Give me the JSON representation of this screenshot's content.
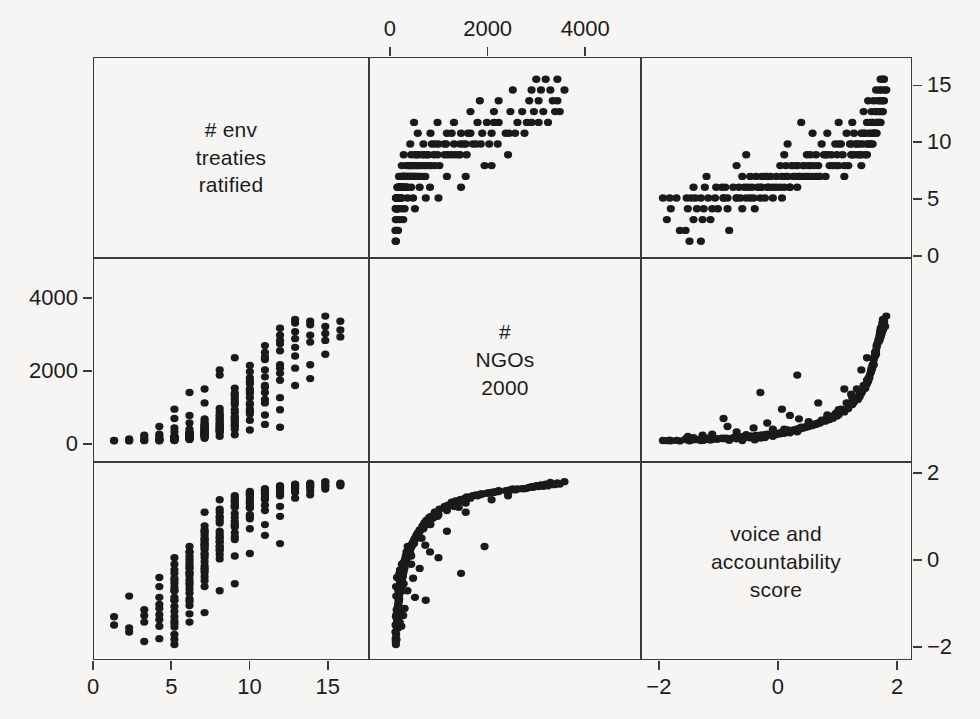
{
  "figure": {
    "type": "scatterplot-matrix",
    "background_color": "#f6f5f3",
    "point_color": "#1a1a1a",
    "frame_color": "#3b3b3b",
    "n_variables": 3
  },
  "variables": [
    {
      "key": "treaties",
      "label_lines": [
        "# env",
        "treaties",
        "ratified"
      ],
      "range": [
        0,
        17.5
      ],
      "ticks": [
        0,
        5,
        10,
        15
      ],
      "tick_labels": [
        "0",
        "5",
        "10",
        "15"
      ]
    },
    {
      "key": "ngos",
      "label_lines": [
        "#",
        "NGOs",
        "2000"
      ],
      "range": [
        -430,
        5100
      ],
      "ticks": [
        0,
        2000,
        4000
      ],
      "tick_labels": [
        "0",
        "2000",
        "4000"
      ]
    },
    {
      "key": "voice",
      "label_lines": [
        "voice and",
        "accountability",
        "score"
      ],
      "range": [
        -2.3,
        2.25
      ],
      "ticks": [
        -2,
        0,
        2
      ],
      "tick_labels": [
        "−2",
        "0",
        "2"
      ]
    }
  ],
  "axes": {
    "top": {
      "variable": "ngos",
      "labels": [
        "0",
        "2000",
        "4000"
      ]
    },
    "right_row1": {
      "variable": "treaties",
      "labels": [
        "0",
        "5",
        "10",
        "15"
      ]
    },
    "left_row2": {
      "variable": "ngos",
      "labels": [
        "0",
        "2000",
        "4000"
      ]
    },
    "right_row3": {
      "variable": "voice",
      "labels": [
        "−2",
        "0",
        "2"
      ]
    },
    "bottom_col1": {
      "variable": "treaties",
      "labels": [
        "0",
        "5",
        "10",
        "15"
      ]
    },
    "bottom_col3": {
      "variable": "voice",
      "labels": [
        "−2",
        "0",
        "2"
      ]
    }
  },
  "chart_data": {
    "type": "scatter",
    "title": "",
    "layout": "3x3 scatterplot matrix, diagonal holds variable names",
    "variables": [
      "# env treaties ratified",
      "# NGOs 2000",
      "voice and accountability score"
    ],
    "axis_ranges": {
      "treaties": [
        0,
        17.5
      ],
      "ngos": [
        -430,
        5100
      ],
      "voice": [
        -2.3,
        2.25
      ]
    },
    "grid": false,
    "legend": "none",
    "relationships": {
      "treaties_vs_ngos": "positive, strongly nonlinear; treaties saturate as NGOs rise",
      "treaties_vs_voice": "positive, moderate spread; treaties discrete integers",
      "ngos_vs_voice": "positive, exponential / hockey-stick; NGOs explode at high voice"
    },
    "points": [
      [
        1,
        8,
        -1.55
      ],
      [
        1,
        15,
        -1.35
      ],
      [
        2,
        22,
        -0.85
      ],
      [
        2,
        5,
        -1.72
      ],
      [
        3,
        30,
        -1.18
      ],
      [
        3,
        12,
        -1.95
      ],
      [
        4,
        45,
        -1.42
      ],
      [
        4,
        18,
        -0.62
      ],
      [
        4,
        60,
        -1.05
      ],
      [
        4,
        9,
        -1.88
      ],
      [
        4,
        38,
        -0.4
      ],
      [
        4,
        25,
        -1.3
      ],
      [
        5,
        70,
        -0.95
      ],
      [
        5,
        35,
        -1.6
      ],
      [
        5,
        110,
        -0.55
      ],
      [
        5,
        52,
        -1.22
      ],
      [
        5,
        20,
        -1.78
      ],
      [
        5,
        88,
        -0.3
      ],
      [
        5,
        140,
        -0.08
      ],
      [
        5,
        44,
        -1.45
      ],
      [
        5,
        66,
        -0.72
      ],
      [
        5,
        28,
        -1.9
      ],
      [
        5,
        95,
        -0.48
      ],
      [
        5,
        15,
        -2.02
      ],
      [
        5,
        120,
        -0.65
      ],
      [
        5,
        58,
        -1.1
      ],
      [
        5,
        33,
        -1.52
      ],
      [
        5,
        102,
        -0.22
      ],
      [
        5,
        77,
        -0.88
      ],
      [
        5,
        48,
        -1.35
      ],
      [
        6,
        160,
        -0.35
      ],
      [
        6,
        85,
        -0.92
      ],
      [
        6,
        210,
        0.05
      ],
      [
        6,
        120,
        -0.58
      ],
      [
        6,
        55,
        -1.28
      ],
      [
        6,
        175,
        -0.15
      ],
      [
        6,
        95,
        -0.78
      ],
      [
        6,
        240,
        0.22
      ],
      [
        6,
        140,
        -0.45
      ],
      [
        6,
        68,
        -1.08
      ],
      [
        6,
        190,
        -0.02
      ],
      [
        6,
        110,
        -0.68
      ],
      [
        6,
        45,
        -1.48
      ],
      [
        6,
        225,
        0.12
      ],
      [
        6,
        130,
        -0.52
      ],
      [
        6,
        80,
        -0.98
      ],
      [
        6,
        265,
        0.35
      ],
      [
        6,
        150,
        -0.28
      ],
      [
        7,
        300,
        0.28
      ],
      [
        7,
        180,
        -0.22
      ],
      [
        7,
        420,
        0.55
      ],
      [
        7,
        240,
        0.08
      ],
      [
        7,
        140,
        -0.48
      ],
      [
        7,
        360,
        0.42
      ],
      [
        7,
        200,
        -0.12
      ],
      [
        7,
        480,
        0.68
      ],
      [
        7,
        280,
        0.18
      ],
      [
        7,
        160,
        -0.38
      ],
      [
        7,
        390,
        0.48
      ],
      [
        7,
        220,
        -0.02
      ],
      [
        7,
        520,
        0.75
      ],
      [
        7,
        320,
        0.32
      ],
      [
        7,
        175,
        -0.28
      ],
      [
        7,
        450,
        0.62
      ],
      [
        7,
        260,
        0.15
      ],
      [
        7,
        120,
        -0.62
      ],
      [
        7,
        580,
        0.85
      ],
      [
        7,
        340,
        0.38
      ],
      [
        7,
        195,
        -0.18
      ],
      [
        7,
        410,
        0.52
      ],
      [
        8,
        620,
        0.92
      ],
      [
        8,
        380,
        0.45
      ],
      [
        8,
        240,
        0.05
      ],
      [
        8,
        720,
        1.05
      ],
      [
        8,
        450,
        0.58
      ],
      [
        8,
        300,
        0.25
      ],
      [
        8,
        840,
        1.18
      ],
      [
        8,
        520,
        0.72
      ],
      [
        8,
        350,
        0.35
      ],
      [
        8,
        660,
        0.98
      ],
      [
        8,
        280,
        0.15
      ],
      [
        8,
        940,
        1.25
      ],
      [
        8,
        480,
        0.65
      ],
      [
        8,
        400,
        0.48
      ],
      [
        8,
        760,
        1.08
      ],
      [
        8,
        320,
        0.28
      ],
      [
        9,
        1050,
        1.32
      ],
      [
        9,
        580,
        0.82
      ],
      [
        9,
        420,
        0.52
      ],
      [
        9,
        1200,
        1.42
      ],
      [
        9,
        700,
        0.95
      ],
      [
        9,
        500,
        0.68
      ],
      [
        9,
        1380,
        1.48
      ],
      [
        9,
        820,
        1.05
      ],
      [
        9,
        620,
        0.85
      ],
      [
        9,
        1120,
        1.35
      ],
      [
        9,
        460,
        0.58
      ],
      [
        9,
        1520,
        1.55
      ],
      [
        9,
        900,
        1.15
      ],
      [
        9,
        680,
        0.88
      ],
      [
        9,
        1280,
        1.45
      ],
      [
        10,
        1650,
        1.58
      ],
      [
        10,
        1050,
        1.28
      ],
      [
        10,
        780,
        1.02
      ],
      [
        10,
        1820,
        1.62
      ],
      [
        10,
        1250,
        1.38
      ],
      [
        10,
        920,
        1.12
      ],
      [
        10,
        2000,
        1.65
      ],
      [
        10,
        1450,
        1.5
      ],
      [
        10,
        1080,
        1.3
      ],
      [
        10,
        1720,
        1.6
      ],
      [
        10,
        850,
        1.08
      ],
      [
        10,
        2180,
        1.68
      ],
      [
        10,
        1380,
        1.45
      ],
      [
        11,
        2350,
        1.7
      ],
      [
        11,
        1600,
        1.55
      ],
      [
        11,
        1200,
        1.35
      ],
      [
        11,
        2550,
        1.72
      ],
      [
        11,
        1850,
        1.62
      ],
      [
        11,
        1400,
        1.48
      ],
      [
        11,
        2750,
        1.75
      ],
      [
        11,
        2050,
        1.66
      ],
      [
        11,
        1550,
        1.52
      ],
      [
        11,
        2420,
        1.71
      ],
      [
        12,
        2900,
        1.78
      ],
      [
        12,
        2200,
        1.68
      ],
      [
        12,
        1750,
        1.58
      ],
      [
        12,
        3050,
        1.8
      ],
      [
        12,
        2600,
        1.74
      ],
      [
        12,
        1950,
        1.64
      ],
      [
        12,
        3250,
        1.82
      ],
      [
        12,
        2800,
        1.76
      ],
      [
        12,
        2100,
        1.67
      ],
      [
        13,
        3400,
        1.85
      ],
      [
        13,
        2950,
        1.79
      ],
      [
        13,
        2450,
        1.72
      ],
      [
        13,
        3150,
        1.81
      ],
      [
        13,
        2700,
        1.75
      ],
      [
        13,
        3500,
        1.86
      ],
      [
        14,
        3450,
        1.88
      ],
      [
        14,
        3050,
        1.82
      ],
      [
        14,
        2850,
        1.78
      ],
      [
        14,
        3350,
        1.85
      ],
      [
        15,
        3300,
        1.9
      ],
      [
        15,
        3100,
        1.84
      ],
      [
        15,
        2900,
        1.8
      ],
      [
        16,
        3200,
        1.86
      ],
      [
        16,
        3000,
        1.82
      ],
      [
        6,
        1400,
        -0.3
      ],
      [
        5,
        650,
        -0.95
      ],
      [
        7,
        80,
        -1.25
      ],
      [
        8,
        1900,
        0.35
      ],
      [
        9,
        180,
        -0.55
      ],
      [
        10,
        320,
        0.18
      ],
      [
        11,
        480,
        0.62
      ],
      [
        12,
        900,
        1.08
      ],
      [
        4,
        200,
        -1.15
      ],
      [
        3,
        95,
        -1.48
      ],
      [
        13,
        1600,
        1.52
      ],
      [
        14,
        2200,
        1.7
      ],
      [
        6,
        520,
        -0.18
      ],
      [
        7,
        1100,
        0.72
      ],
      [
        8,
        140,
        -0.72
      ],
      [
        9,
        2400,
        1.58
      ],
      [
        5,
        380,
        -0.42
      ],
      [
        10,
        1500,
        1.4
      ],
      [
        11,
        750,
        0.88
      ],
      [
        12,
        400,
        0.42
      ],
      [
        2,
        60,
        -1.62
      ],
      [
        15,
        2500,
        1.74
      ],
      [
        6,
        340,
        -0.08
      ],
      [
        7,
        640,
        0.38
      ],
      [
        8,
        2050,
        1.48
      ],
      [
        9,
        1350,
        1.3
      ],
      [
        4,
        420,
        -0.88
      ],
      [
        13,
        2100,
        1.66
      ],
      [
        5,
        260,
        -0.72
      ],
      [
        10,
        600,
        0.78
      ],
      [
        11,
        1100,
        1.22
      ],
      [
        3,
        170,
        -1.32
      ],
      [
        14,
        1800,
        1.6
      ],
      [
        6,
        740,
        0.22
      ],
      [
        7,
        1500,
        1.18
      ],
      [
        8,
        560,
        0.55
      ],
      [
        9,
        340,
        0.12
      ],
      [
        12,
        1250,
        1.32
      ],
      [
        5,
        920,
        0.08
      ],
      [
        4,
        130,
        -1.58
      ],
      [
        16,
        3450,
        1.88
      ],
      [
        15,
        3600,
        1.92
      ]
    ]
  }
}
